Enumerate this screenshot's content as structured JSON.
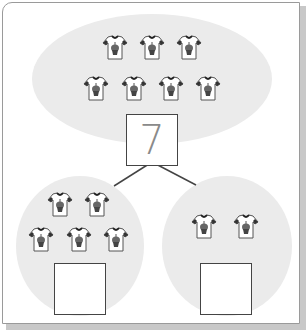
{
  "diagram": {
    "type": "number-bond",
    "whole": {
      "value": "7",
      "shirt_count": 7,
      "icon": "tshirt-icon"
    },
    "parts": [
      {
        "value": "",
        "shirt_count": 5,
        "icon": "tshirt-icon"
      },
      {
        "value": "",
        "shirt_count": 2,
        "icon": "tshirt-icon"
      }
    ]
  },
  "colors": {
    "ellipse_fill": "#ebebeb",
    "box_border": "#444444",
    "number_color": "#8a8a8a",
    "card_border": "#9a9a9a",
    "shadow": "#c8c8c8"
  }
}
